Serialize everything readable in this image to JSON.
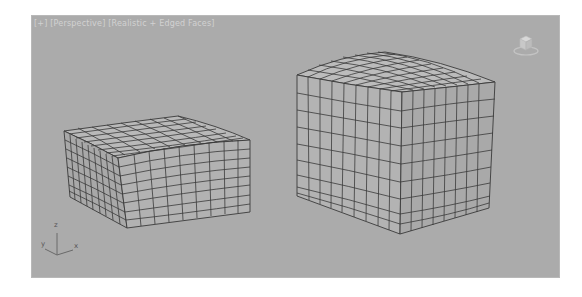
{
  "viewport": {
    "label_parts": [
      "[+]",
      "[Perspective]",
      "[Realistic + Edged Faces]"
    ],
    "background": "#ababab",
    "wire_color": "#333333"
  },
  "axis_tripod": {
    "z_label": "z",
    "y_label": "y",
    "x_label": "x"
  },
  "objects": [
    {
      "name": "box-concave-top",
      "deformation": "concave top"
    },
    {
      "name": "box-convex-top",
      "deformation": "convex top"
    }
  ]
}
